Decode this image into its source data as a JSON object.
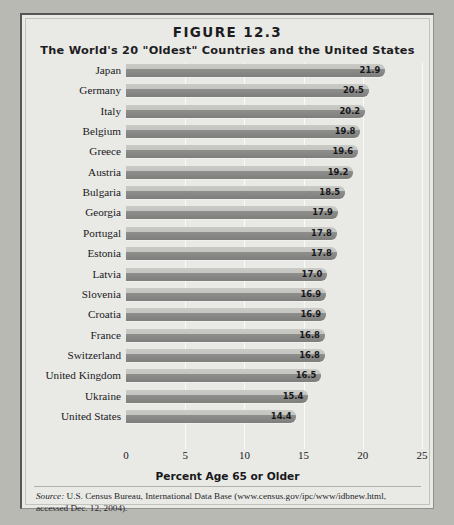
{
  "figure": {
    "number": "FIGURE 12.3",
    "title": "The World's 20 \"Oldest\" Countries and the United States",
    "source_label": "Source:",
    "source_text": " U.S. Census Bureau, International Data Base (www.census.gov/ipc/www/idbnew.html, accessed Dec. 12, 2004)."
  },
  "chart_data": {
    "type": "bar",
    "orientation": "horizontal",
    "title": "The World's 20 \"Oldest\" Countries and the United States",
    "subtitle": "FIGURE 12.3",
    "xlabel": "Percent Age 65 or Older",
    "ylabel": "",
    "xlim": [
      0,
      25
    ],
    "xticks": [
      0,
      5,
      10,
      15,
      20,
      25
    ],
    "grid": true,
    "legend": false,
    "bar_color": "#8e8e8c",
    "categories": [
      "Japan",
      "Germany",
      "Italy",
      "Belgium",
      "Greece",
      "Austria",
      "Bulgaria",
      "Georgia",
      "Portugal",
      "Estonia",
      "Latvia",
      "Slovenia",
      "Croatia",
      "France",
      "Switzerland",
      "United Kingdom",
      "Ukraine",
      "United States"
    ],
    "values": [
      21.9,
      20.5,
      20.2,
      19.8,
      19.6,
      19.2,
      18.5,
      17.9,
      17.8,
      17.8,
      17.0,
      16.9,
      16.9,
      16.8,
      16.8,
      16.5,
      15.4,
      14.4
    ],
    "value_labels": [
      "21.9",
      "20.5",
      "20.2",
      "19.8",
      "19.6",
      "19.2",
      "18.5",
      "17.9",
      "17.8",
      "17.8",
      "17.0",
      "16.9",
      "16.9",
      "16.8",
      "16.8",
      "16.5",
      "15.4",
      "14.4"
    ]
  }
}
